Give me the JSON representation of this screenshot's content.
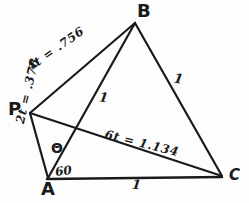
{
  "figure": {
    "kind": "hand-drawn-geometry-diagram",
    "background_color": "#fdfdfd",
    "ink_color": "#1a1a1a",
    "width": 249,
    "height": 203,
    "vertices": [
      {
        "name": "A",
        "label": "A",
        "x": 48,
        "y": 178
      },
      {
        "name": "B",
        "label": "B",
        "x": 135,
        "y": 23
      },
      {
        "name": "C",
        "label": "C",
        "x": 222,
        "y": 176
      },
      {
        "name": "P",
        "label": "P",
        "x": 30,
        "y": 113
      }
    ],
    "segments": [
      {
        "name": "side-AB",
        "from": "A",
        "to": "B",
        "length_label": "1"
      },
      {
        "name": "side-BC",
        "from": "B",
        "to": "C",
        "length_label": "1"
      },
      {
        "name": "side-AC",
        "from": "A",
        "to": "C",
        "length_label": "1"
      },
      {
        "name": "segment-PA",
        "from": "P",
        "to": "A",
        "length_label": "2t = .378"
      },
      {
        "name": "segment-PB",
        "from": "P",
        "to": "B",
        "length_label": "4t = .756"
      },
      {
        "name": "segment-PC",
        "from": "P",
        "to": "C",
        "length_label": "6t = 1.134"
      }
    ],
    "edge_labels": {
      "pb": "4t = .756",
      "pa": "2t = .378",
      "pc": "6t = 1.134",
      "bc": "1",
      "ab_inner": "1",
      "ac": "1"
    },
    "angle_labels": {
      "theta": "Θ",
      "sixty": "60"
    }
  }
}
